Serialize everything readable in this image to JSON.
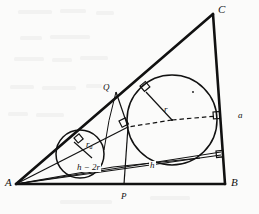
{
  "figure": {
    "background_color": "#fbfbfa",
    "stroke_color": "#111111",
    "vertices": [
      {
        "name": "A",
        "label": "A",
        "x": 16,
        "y": 184
      },
      {
        "name": "B",
        "label": "B",
        "x": 225,
        "y": 184
      },
      {
        "name": "C",
        "label": "C",
        "x": 213,
        "y": 14
      }
    ],
    "labels": [
      {
        "name": "vertex-label-A",
        "text": "A",
        "x": 5,
        "y": 178,
        "size": "vertex"
      },
      {
        "name": "vertex-label-B",
        "text": "B",
        "x": 232,
        "y": 178,
        "size": "vertex"
      },
      {
        "name": "vertex-label-C",
        "text": "C",
        "x": 218,
        "y": 5,
        "size": "vertex"
      },
      {
        "name": "point-label-P",
        "text": "P",
        "x": 122,
        "y": 193,
        "size": "small"
      },
      {
        "name": "point-label-Q",
        "text": "Q",
        "x": 104,
        "y": 84,
        "size": "small"
      },
      {
        "name": "radius-label-r",
        "text": "r",
        "x": 165,
        "y": 106,
        "size": "small"
      },
      {
        "name": "side-label-a",
        "text": "a",
        "x": 239,
        "y": 112,
        "size": "small"
      }
    ],
    "math_labels": [
      {
        "name": "radius-label-ra",
        "base": "r",
        "subscript": "a",
        "x": 86,
        "y": 140,
        "size": "small"
      },
      {
        "name": "segment-label-h-minus-2r",
        "text": "h − 2r",
        "x": 80,
        "y": 165,
        "size": "small"
      },
      {
        "name": "segment-label-h",
        "text": "h",
        "x": 150,
        "y": 162,
        "size": "small"
      }
    ],
    "circles": [
      {
        "name": "incircle",
        "cx": 172,
        "cy": 120,
        "r": 45,
        "label": "r"
      },
      {
        "name": "small-circle",
        "cx": 80,
        "cy": 154,
        "r": 24,
        "label": "r_a"
      }
    ],
    "right_angle_marks": [
      {
        "name": "right-angle-mark-incircle-AC",
        "x": 140,
        "y": 89
      },
      {
        "name": "right-angle-mark-incircle-BC",
        "x": 222,
        "y": 115
      },
      {
        "name": "right-angle-mark-chord",
        "x": 122,
        "y": 124
      },
      {
        "name": "right-angle-mark-small-circle",
        "x": 78,
        "y": 142
      },
      {
        "name": "right-angle-mark-lower-BC",
        "x": 226,
        "y": 156
      }
    ],
    "segments": [
      {
        "name": "side-AB",
        "from": "A",
        "to": "B",
        "style": "solid",
        "weight": "thick"
      },
      {
        "name": "side-BC",
        "from": "B",
        "to": "C",
        "style": "solid",
        "weight": "thick"
      },
      {
        "name": "side-CA",
        "from": "C",
        "to": "A",
        "style": "solid",
        "weight": "thick"
      },
      {
        "name": "radius-r-segment",
        "style": "solid",
        "weight": "thin"
      },
      {
        "name": "dashed-radius-to-BC",
        "style": "dashed",
        "weight": "thin"
      },
      {
        "name": "cevian-A-to-tangency",
        "style": "solid",
        "weight": "thin"
      },
      {
        "name": "chord-h",
        "style": "solid",
        "weight": "thin"
      },
      {
        "name": "chord-h-minus-2r",
        "style": "solid",
        "weight": "thin"
      },
      {
        "name": "vertical-P-line",
        "style": "solid",
        "weight": "thin"
      }
    ]
  }
}
